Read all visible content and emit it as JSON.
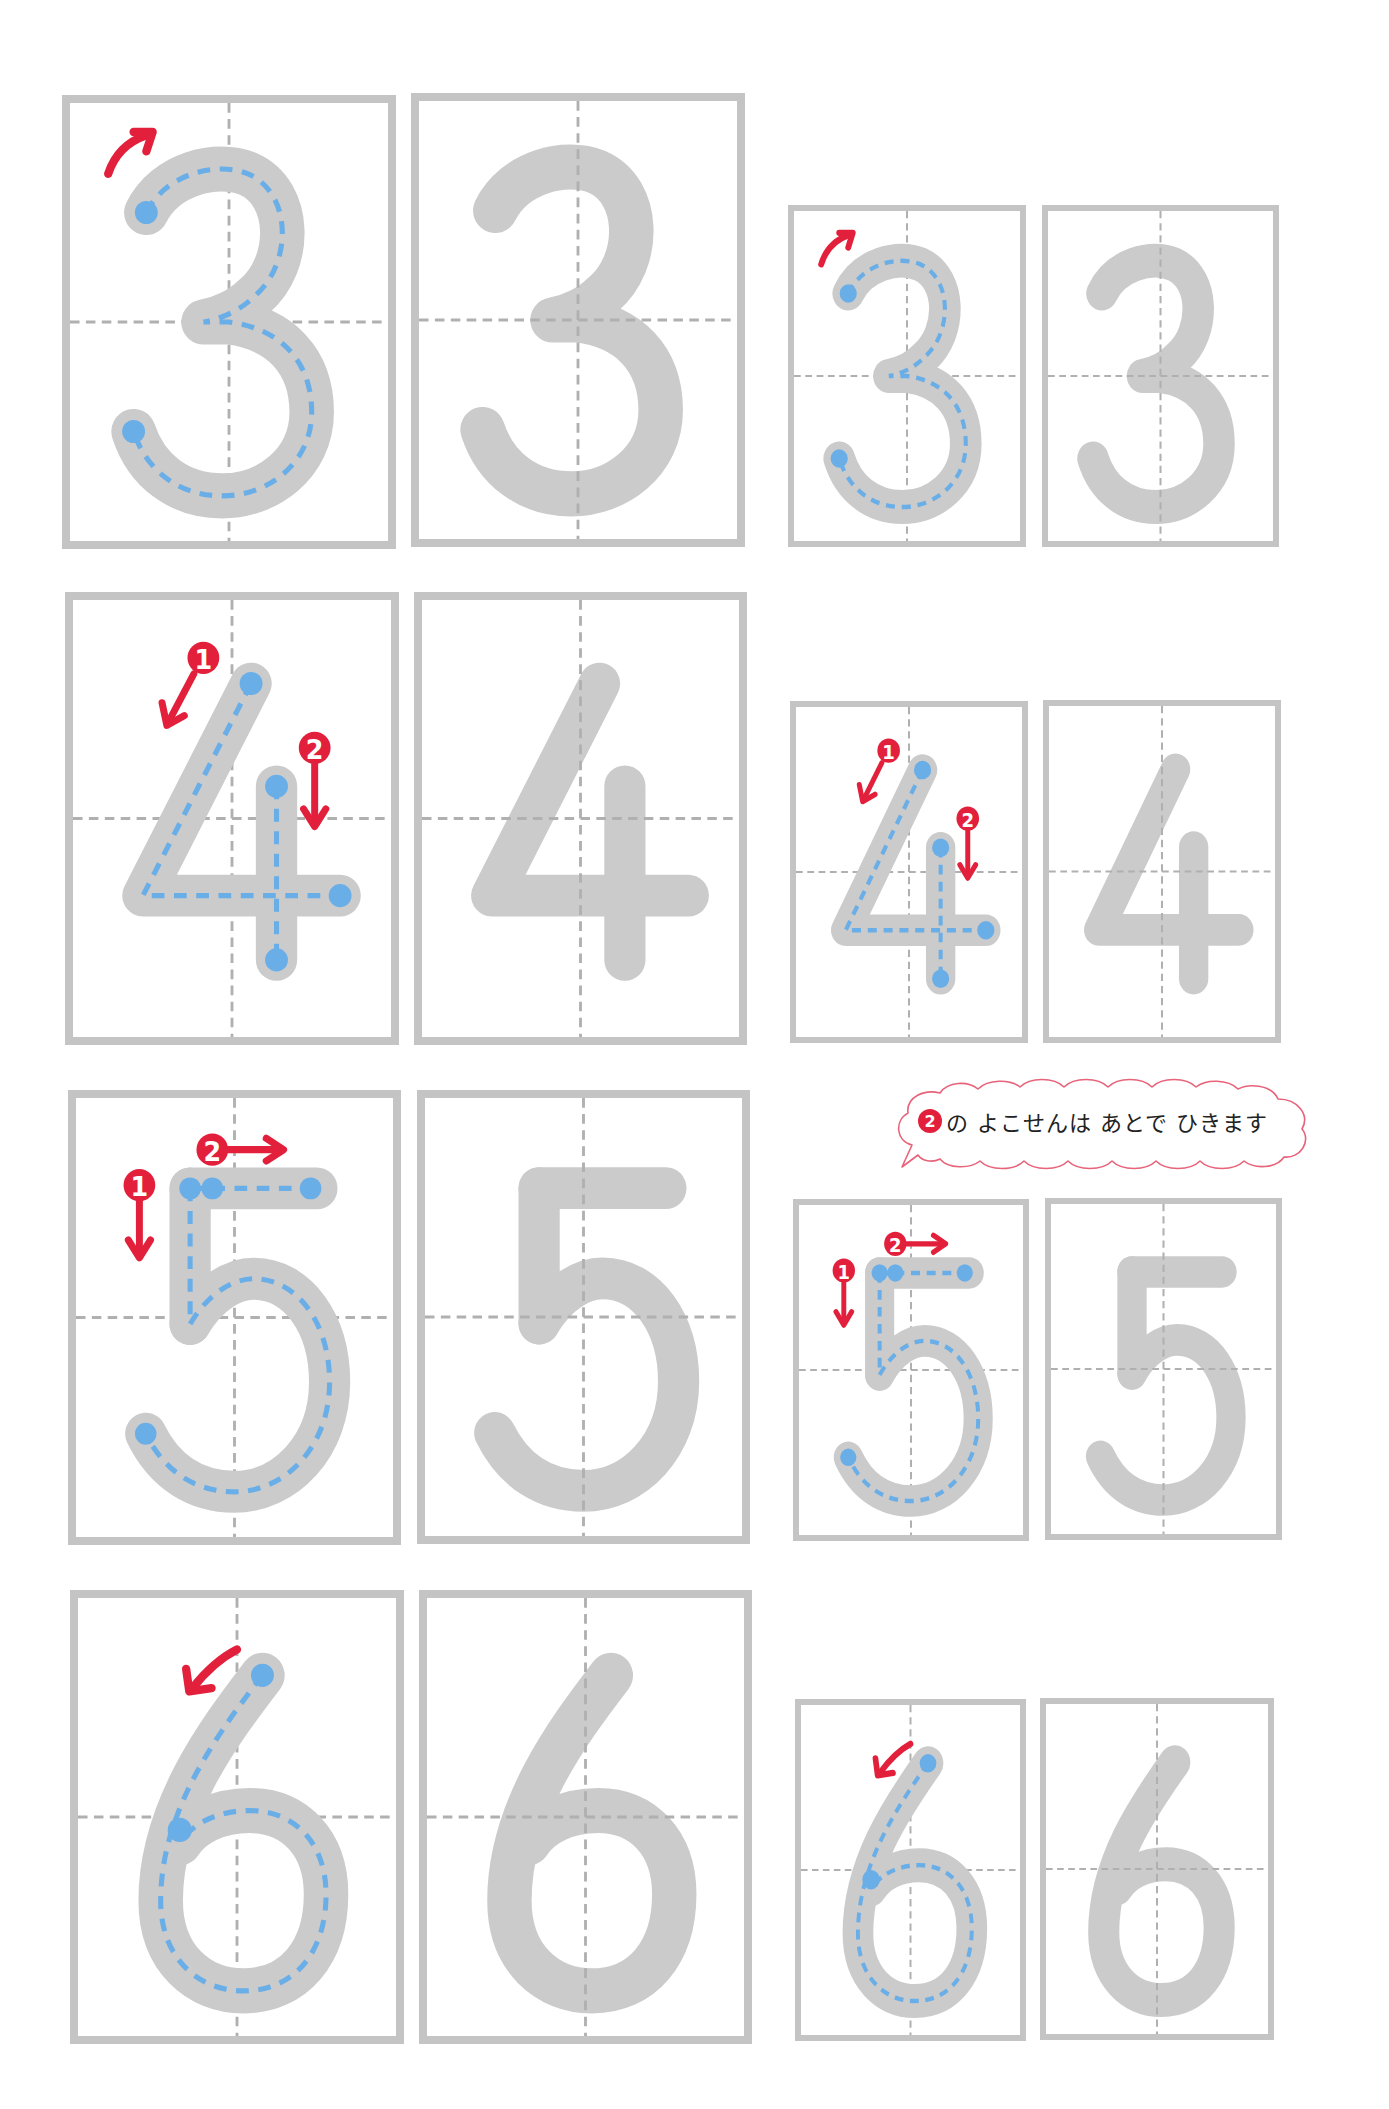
{
  "worksheet": {
    "subject": "number tracing practice",
    "colors": {
      "box_border": "#c4c4c4",
      "guide_line": "#b0b0b0",
      "glyph_fill": "#cbcbcb",
      "trace_dash": "#6aaee8",
      "start_dot": "#6aaee8",
      "arrow": "#e3203c"
    },
    "rows": [
      {
        "digit": "3",
        "strokes": 1,
        "stroke_order_labels": [],
        "boxes": [
          {
            "size": "large",
            "style": "trace-guide",
            "digit": "3"
          },
          {
            "size": "large",
            "style": "faded",
            "digit": "3"
          },
          {
            "size": "small",
            "style": "trace-guide",
            "digit": "3"
          },
          {
            "size": "small",
            "style": "faded",
            "digit": "3"
          }
        ]
      },
      {
        "digit": "4",
        "strokes": 2,
        "stroke_order_labels": [
          "1",
          "2"
        ],
        "boxes": [
          {
            "size": "large",
            "style": "trace-guide",
            "digit": "4"
          },
          {
            "size": "large",
            "style": "faded",
            "digit": "4"
          },
          {
            "size": "small",
            "style": "trace-guide",
            "digit": "4"
          },
          {
            "size": "small",
            "style": "faded",
            "digit": "4"
          }
        ]
      },
      {
        "digit": "5",
        "strokes": 2,
        "stroke_order_labels": [
          "1",
          "2"
        ],
        "boxes": [
          {
            "size": "large",
            "style": "trace-guide",
            "digit": "5"
          },
          {
            "size": "large",
            "style": "faded",
            "digit": "5"
          },
          {
            "size": "small",
            "style": "trace-guide",
            "digit": "5"
          },
          {
            "size": "small",
            "style": "faded",
            "digit": "5"
          }
        ]
      },
      {
        "digit": "6",
        "strokes": 1,
        "stroke_order_labels": [],
        "boxes": [
          {
            "size": "large",
            "style": "trace-guide",
            "digit": "6"
          },
          {
            "size": "large",
            "style": "faded",
            "digit": "6"
          },
          {
            "size": "small",
            "style": "trace-guide",
            "digit": "6"
          },
          {
            "size": "small",
            "style": "faded",
            "digit": "6"
          }
        ]
      }
    ],
    "note_bubble": {
      "badge": "2",
      "text": "の よこせんは あとで ひきます"
    }
  }
}
